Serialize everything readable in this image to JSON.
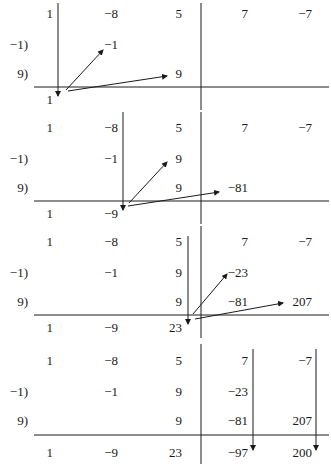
{
  "panels": [
    {
      "coefficients": [
        "1",
        "−8",
        "5",
        "7",
        "−7"
      ],
      "divisor_labels": [
        "−1)",
        "9)"
      ],
      "row1": [
        "",
        "−1",
        "",
        "",
        ""
      ],
      "row2": [
        "",
        "",
        "9",
        "",
        ""
      ],
      "result": [
        "1",
        "",
        "",
        "",
        ""
      ]
    },
    {
      "coefficients": [
        "1",
        "−8",
        "5",
        "7",
        "−7"
      ],
      "divisor_labels": [
        "−1)",
        "9)"
      ],
      "row1": [
        "",
        "−1",
        "9",
        "",
        ""
      ],
      "row2": [
        "",
        "",
        "9",
        "−81",
        ""
      ],
      "result": [
        "1",
        "−9",
        "",
        "",
        ""
      ]
    },
    {
      "coefficients": [
        "1",
        "−8",
        "5",
        "7",
        "−7"
      ],
      "divisor_labels": [
        "−1)",
        "9)"
      ],
      "row1": [
        "",
        "−1",
        "9",
        "−23",
        ""
      ],
      "row2": [
        "",
        "",
        "9",
        "−81",
        "207"
      ],
      "result": [
        "1",
        "−9",
        "23",
        "",
        ""
      ]
    },
    {
      "coefficients": [
        "1",
        "−8",
        "5",
        "7",
        "−7"
      ],
      "divisor_labels": [
        "−1)",
        "9)"
      ],
      "row1": [
        "",
        "−1",
        "9",
        "−23",
        ""
      ],
      "row2": [
        "",
        "",
        "9",
        "−81",
        "207"
      ],
      "result": [
        "1",
        "−9",
        "23",
        "−97",
        "200"
      ]
    }
  ]
}
